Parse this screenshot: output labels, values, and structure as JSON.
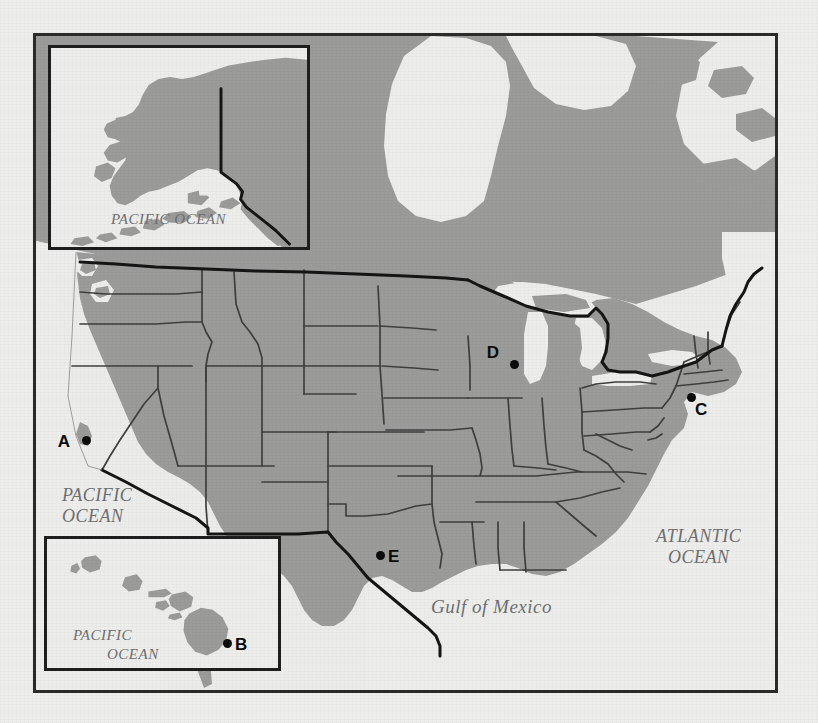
{
  "map": {
    "title": "United States reference map with Alaska and Hawaii insets",
    "colors": {
      "land": "#9b9b99",
      "water": "#ededeb",
      "page_background": "#eeeeec",
      "border": "#2b2b2b",
      "state_line": "#3a3a3a",
      "national_line": "#141414",
      "label_text": "#6f6f72",
      "point_marker": "#0c0c0c"
    },
    "ocean_labels": [
      {
        "id": "pacific-main",
        "text": "PACIFIC\nOCEAN",
        "style": "italic-serif-caps"
      },
      {
        "id": "atlantic",
        "text": "ATLANTIC\nOCEAN",
        "style": "italic-serif-caps"
      },
      {
        "id": "gulf-of-mexico",
        "text": "Gulf of Mexico",
        "style": "italic-serif-mixed"
      },
      {
        "id": "pacific-alaska",
        "text": "PACIFIC OCEAN",
        "style": "italic-serif-caps"
      }
    ],
    "insets": [
      {
        "id": "alaska",
        "name": "Alaska inset",
        "ocean_label": "PACIFIC OCEAN"
      },
      {
        "id": "hawaii",
        "name": "Hawaii inset",
        "ocean_label_line1": "PACIFIC",
        "ocean_label_line2": "OCEAN"
      }
    ],
    "points": [
      {
        "id": "A",
        "label": "A",
        "region": "California coast",
        "label_position": "left",
        "x": 46,
        "y": 400
      },
      {
        "id": "B",
        "label": "B",
        "region": "Hawaii (Big Island)",
        "label_position": "right",
        "x": 176,
        "y": 100
      },
      {
        "id": "C",
        "label": "C",
        "region": "New York / Long Island",
        "label_position": "bottom-right",
        "x": 651,
        "y": 357
      },
      {
        "id": "D",
        "label": "D",
        "region": "Illinois / Wisconsin",
        "label_position": "top-left",
        "x": 474,
        "y": 324
      },
      {
        "id": "E",
        "label": "E",
        "region": "Texas",
        "label_position": "right",
        "x": 340,
        "y": 515
      }
    ]
  }
}
